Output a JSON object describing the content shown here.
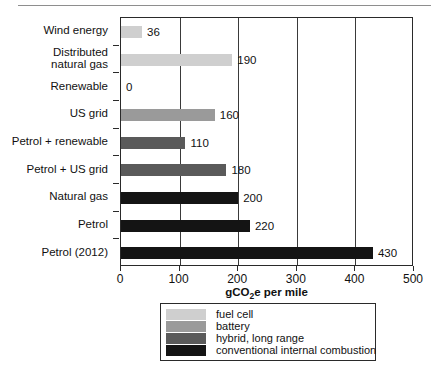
{
  "chart_data": {
    "type": "bar",
    "orientation": "horizontal",
    "title": "",
    "xlabel": "gCO2e per mile",
    "xlabel_rich": {
      "prefix": "gCO",
      "sub": "2",
      "suffix": "e per mile"
    },
    "ylabel": "",
    "xlim": [
      0,
      500
    ],
    "xticks": [
      0,
      100,
      200,
      300,
      400,
      500
    ],
    "xticklabels": [
      "0",
      "100",
      "200",
      "300",
      "400",
      "500"
    ],
    "grid": true,
    "grid_axis": "x",
    "legend_position": "below",
    "categories": [
      "Wind energy",
      "Distributed natural gas",
      "Renewable",
      "US grid",
      "Petrol + renewable",
      "Petrol + US grid",
      "Natural gas",
      "Petrol",
      "Petrol (2012)"
    ],
    "values": [
      36,
      190,
      0,
      160,
      110,
      180,
      200,
      220,
      430
    ],
    "value_labels": [
      "36",
      "190",
      "0",
      "160",
      "110",
      "180",
      "200",
      "220",
      "430"
    ],
    "groups": [
      "fuel cell",
      "fuel cell",
      "battery",
      "battery",
      "hybrid, long range",
      "hybrid, long range",
      "conventional internal combustion",
      "conventional internal combustion",
      "conventional internal combustion"
    ],
    "series": [
      {
        "name": "fuel cell",
        "color": "#cfcfcf",
        "key": "fuelcell"
      },
      {
        "name": "battery",
        "color": "#9a9a9a",
        "key": "battery"
      },
      {
        "name": "hybrid, long range",
        "color": "#5a5a5a",
        "key": "hybrid"
      },
      {
        "name": "conventional internal combustion",
        "color": "#141414",
        "key": "conventional"
      }
    ],
    "legend": [
      {
        "label": "fuel cell",
        "key": "fuelcell"
      },
      {
        "label": "battery",
        "key": "battery"
      },
      {
        "label": "hybrid, long range",
        "key": "hybrid"
      },
      {
        "label": "conventional internal combustion",
        "key": "conventional"
      }
    ]
  },
  "categories_display": [
    {
      "line1": "Wind energy",
      "line2": ""
    },
    {
      "line1": "Distributed",
      "line2": "natural gas"
    },
    {
      "line1": "Renewable",
      "line2": ""
    },
    {
      "line1": "US grid",
      "line2": ""
    },
    {
      "line1": "Petrol + renewable",
      "line2": ""
    },
    {
      "line1": "Petrol + US grid",
      "line2": ""
    },
    {
      "line1": "Natural gas",
      "line2": ""
    },
    {
      "line1": "Petrol",
      "line2": ""
    },
    {
      "line1": "Petrol (2012)",
      "line2": ""
    }
  ],
  "colors": {
    "fuelcell": "#cfcfcf",
    "battery": "#9a9a9a",
    "hybrid": "#5a5a5a",
    "conventional": "#141414",
    "axis": "#2a2a2a",
    "grid": "#3a3a3a",
    "text": "#111111",
    "background": "#ffffff"
  }
}
